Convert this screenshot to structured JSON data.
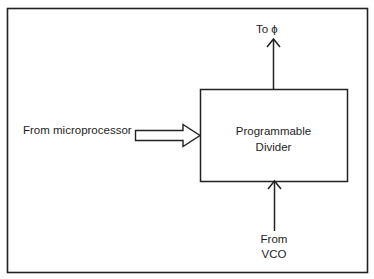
{
  "diagram": {
    "type": "block-diagram",
    "blocks": [
      {
        "id": "divider",
        "label_line1": "Programmable",
        "label_line2": "Divider"
      }
    ],
    "inputs": {
      "microprocessor": {
        "label": "From microprocessor",
        "arrow_style": "hollow-wide"
      },
      "vco": {
        "label_line1": "From",
        "label_line2": "VCO",
        "arrow_style": "line"
      }
    },
    "outputs": {
      "phase": {
        "label": "To ϕ",
        "arrow_style": "line"
      }
    },
    "colors": {
      "stroke": "#222222",
      "background": "#ffffff"
    }
  }
}
